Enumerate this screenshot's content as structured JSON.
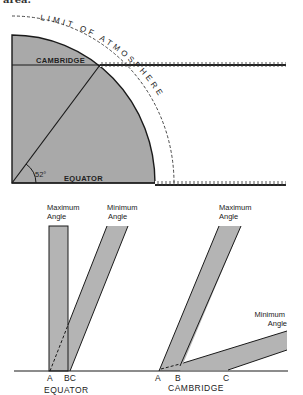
{
  "caption_fragment": "area.",
  "colors": {
    "earth_fill": "#a9a9a9",
    "band_fill": "#b4b4b4",
    "line": "#1a1a1a",
    "background": "#ffffff"
  },
  "top_diagram": {
    "atmosphere_label": "LIMIT OF ATMOSPHERE",
    "cambridge_label": "CAMBRIDGE",
    "equator_label": "EQUATOR",
    "latitude_angle": "52°"
  },
  "bottom_left": {
    "max_angle_label": [
      "Maximum",
      "Angle"
    ],
    "min_angle_label": [
      "Minimum",
      "Angle"
    ],
    "points": [
      "A",
      "BC"
    ],
    "place_label": "EQUATOR"
  },
  "bottom_right": {
    "max_angle_label": [
      "Maximum",
      "Angle"
    ],
    "min_angle_label": [
      "Minimum",
      "Angle"
    ],
    "points": [
      "A",
      "B",
      "C"
    ],
    "place_label": "CAMBRIDGE"
  }
}
